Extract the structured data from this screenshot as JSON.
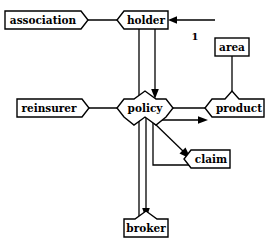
{
  "diagram": {
    "type": "entity-relationship-diagram",
    "background_color": "#ffffff",
    "line_color": "#000000",
    "fill_color": "#ffffff",
    "entities": [
      {
        "id": "association",
        "label": "association",
        "x": 5,
        "y": 11,
        "w": 76,
        "h": 18,
        "notch_left": false,
        "notch_right": true,
        "notch_top": false,
        "notch_bottom": false
      },
      {
        "id": "holder",
        "label": "holder",
        "x": 124,
        "y": 11,
        "w": 44,
        "h": 18,
        "notch_left": true,
        "notch_right": false,
        "notch_top": false,
        "notch_bottom": false
      },
      {
        "id": "area",
        "label": "area",
        "x": 215,
        "y": 38,
        "w": 34,
        "h": 18,
        "notch_left": false,
        "notch_right": false,
        "notch_top": false,
        "notch_bottom": false
      },
      {
        "id": "reinsurer",
        "label": "reinsurer",
        "x": 17,
        "y": 99,
        "w": 65,
        "h": 18,
        "notch_left": false,
        "notch_right": true,
        "notch_top": false,
        "notch_bottom": false
      },
      {
        "id": "policy",
        "label": "policy",
        "x": 124,
        "y": 99,
        "w": 42,
        "h": 18,
        "notch_left": true,
        "notch_right": true,
        "notch_top": true,
        "notch_bottom": true
      },
      {
        "id": "product",
        "label": "product",
        "x": 212,
        "y": 99,
        "w": 52,
        "h": 18,
        "notch_left": true,
        "notch_right": false,
        "notch_top": true,
        "notch_bottom": false
      },
      {
        "id": "claim",
        "label": "claim",
        "x": 191,
        "y": 150,
        "w": 39,
        "h": 18,
        "notch_left": true,
        "notch_right": false,
        "notch_top": false,
        "notch_bottom": false
      },
      {
        "id": "broker",
        "label": "broker",
        "x": 124,
        "y": 219,
        "w": 44,
        "h": 18,
        "notch_left": false,
        "notch_right": false,
        "notch_top": true,
        "notch_bottom": false
      }
    ],
    "cardinality_labels": [
      {
        "id": "card-1",
        "text": "1",
        "x": 195,
        "y": 37
      }
    ],
    "connections": [
      {
        "id": "association-holder",
        "from": "association",
        "to": "holder",
        "arrow": false
      },
      {
        "id": "holder-policy-plain",
        "from": "holder",
        "to": "policy",
        "arrow": false
      },
      {
        "id": "holder-policy-arrow",
        "from": "holder",
        "to": "policy",
        "arrow": true
      },
      {
        "id": "external-holder",
        "from": "external",
        "to": "holder",
        "arrow": true
      },
      {
        "id": "area-product",
        "from": "area",
        "to": "product",
        "arrow": false
      },
      {
        "id": "reinsurer-policy",
        "from": "reinsurer",
        "to": "policy",
        "arrow": false
      },
      {
        "id": "policy-product",
        "from": "policy",
        "to": "product",
        "arrow": false
      },
      {
        "id": "policy-product-arrow",
        "from": "policy",
        "to": "product",
        "arrow": true
      },
      {
        "id": "policy-claim-diag",
        "from": "policy",
        "to": "claim",
        "arrow": true
      },
      {
        "id": "policy-claim-elbow",
        "from": "policy",
        "to": "claim",
        "arrow": false
      },
      {
        "id": "policy-broker-plain",
        "from": "policy",
        "to": "broker",
        "arrow": false
      },
      {
        "id": "policy-broker-arrow",
        "from": "policy",
        "to": "broker",
        "arrow": true
      }
    ]
  }
}
